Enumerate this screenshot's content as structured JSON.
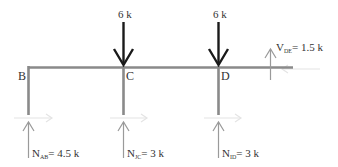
{
  "diagram": {
    "type": "free-body-diagram",
    "nodes": [
      {
        "id": "B",
        "label": "B"
      },
      {
        "id": "C",
        "label": "C"
      },
      {
        "id": "D",
        "label": "D"
      }
    ],
    "applied_loads": [
      {
        "at": "C",
        "label": "6 k",
        "direction": "down"
      },
      {
        "at": "D",
        "label": "6 k",
        "direction": "down"
      }
    ],
    "reactions": [
      {
        "at": "B",
        "symbol": "N",
        "subscript": "AB",
        "value": "= 4.5 k",
        "direction": "up"
      },
      {
        "at": "C",
        "symbol": "N",
        "subscript": "JC",
        "value": "= 3 k",
        "direction": "up"
      },
      {
        "at": "D",
        "symbol": "N",
        "subscript": "ID",
        "value": "= 3 k",
        "direction": "up"
      }
    ],
    "end_shear": {
      "symbol": "V",
      "subscript": "DE",
      "value": "= 1.5 k",
      "direction": "up"
    },
    "colors": {
      "member": "#8a8a8a",
      "load_arrow": "#1a1a1a",
      "reaction_arrow": "#9a9a9a",
      "faint_arrow": "#e2e2e2"
    }
  }
}
